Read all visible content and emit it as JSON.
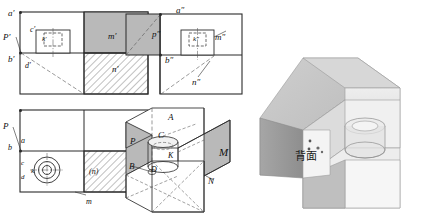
{
  "figure": {
    "kind": "engineering-orthographic-projection-exercise",
    "views": [
      {
        "id": "front-view",
        "name": "front view (V projection)",
        "labels": [
          {
            "key": "a-prime",
            "text": "a′",
            "x": 8,
            "y": 9
          },
          {
            "key": "p-prime",
            "text": "P′",
            "x": 3,
            "y": 33
          },
          {
            "key": "b-prime",
            "text": "b′",
            "x": 8,
            "y": 55
          },
          {
            "key": "c-prime",
            "text": "c′",
            "x": 30,
            "y": 26
          },
          {
            "key": "k-prime",
            "text": "k′",
            "x": 42,
            "y": 36
          },
          {
            "key": "d-prime",
            "text": "d′",
            "x": 25,
            "y": 62
          },
          {
            "key": "m-prime",
            "text": "m′",
            "x": 108,
            "y": 32
          },
          {
            "key": "n-prime",
            "text": "n′",
            "x": 112,
            "y": 65
          }
        ]
      },
      {
        "id": "side-view",
        "name": "left side view (W projection)",
        "labels": [
          {
            "key": "a-dprime",
            "text": "a″",
            "x": 176,
            "y": 6
          },
          {
            "key": "p-dprime",
            "text": "p″",
            "x": 152,
            "y": 30
          },
          {
            "key": "b-dprime",
            "text": "b″",
            "x": 165,
            "y": 56
          },
          {
            "key": "k-dprime",
            "text": "k″",
            "x": 193,
            "y": 36
          },
          {
            "key": "m-dprime",
            "text": "m″",
            "x": 215,
            "y": 33
          },
          {
            "key": "n-dprime",
            "text": "n″",
            "x": 192,
            "y": 78
          }
        ]
      },
      {
        "id": "top-view",
        "name": "top view (H projection)",
        "labels": [
          {
            "key": "p-top",
            "text": "P",
            "x": 3,
            "y": 122
          },
          {
            "key": "a-top",
            "text": "a",
            "x": 21,
            "y": 137
          },
          {
            "key": "b-top",
            "text": "b",
            "x": 8,
            "y": 144
          },
          {
            "key": "c-top",
            "text": "c",
            "x": 21,
            "y": 160
          },
          {
            "key": "k-top",
            "text": "k",
            "x": 31,
            "y": 168
          },
          {
            "key": "d-top",
            "text": "d",
            "x": 21,
            "y": 174
          },
          {
            "key": "n-top",
            "text": "(n)",
            "x": 89,
            "y": 168
          },
          {
            "key": "m-top",
            "text": "m",
            "x": 86,
            "y": 198
          }
        ]
      },
      {
        "id": "axonometric-wireframe",
        "name": "axonometric wireframe with hidden edges",
        "labels": [
          {
            "key": "a-iso",
            "text": "A",
            "x": 168,
            "y": 113
          },
          {
            "key": "p-iso",
            "text": "P",
            "x": 130,
            "y": 137
          },
          {
            "key": "c-iso",
            "text": "C",
            "x": 158,
            "y": 131
          },
          {
            "key": "k-iso",
            "text": "K",
            "x": 168,
            "y": 152
          },
          {
            "key": "b-iso",
            "text": "B",
            "x": 129,
            "y": 162
          },
          {
            "key": "d-iso",
            "text": "D",
            "x": 151,
            "y": 166
          },
          {
            "key": "m-iso",
            "text": "M",
            "x": 219,
            "y": 147
          },
          {
            "key": "n-iso",
            "text": "N",
            "x": 208,
            "y": 177
          }
        ]
      },
      {
        "id": "shaded-solid",
        "name": "shaded 3D solid model",
        "labels": [
          {
            "key": "back-face-note",
            "text": "背面",
            "x": 295,
            "y": 151
          }
        ]
      }
    ],
    "colors": {
      "line": "#2b2b2b",
      "thin_line": "#555555",
      "hatch": "#4a4a4a",
      "gray_fill": "#b9b9b9",
      "solid_light": "#e6e6e6",
      "solid_mid": "#c6c6c6",
      "solid_dark": "#a9a9a9",
      "solid_darker": "#8f8f8f",
      "background": "#ffffff"
    }
  }
}
